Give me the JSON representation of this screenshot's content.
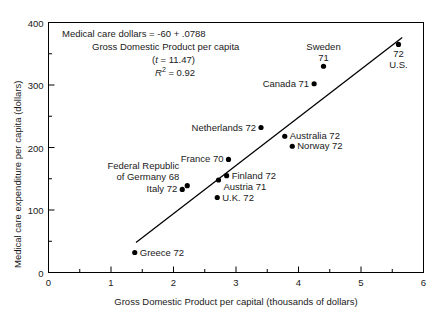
{
  "chart_data": {
    "type": "scatter",
    "title": "",
    "xlabel": "Gross Domestic Product per capital (thousands of dollars)",
    "ylabel": "Medical care expenditure per capita (dollars)",
    "xlim": [
      0,
      6
    ],
    "ylim": [
      0,
      400
    ],
    "xticks": [
      0,
      1,
      2,
      3,
      4,
      5,
      6
    ],
    "xtick_labels": [
      "0",
      "1",
      "2",
      "3",
      "4",
      "5",
      "6"
    ],
    "x_minor_step": 0.5,
    "yticks": [
      0,
      100,
      200,
      300,
      400
    ],
    "ytick_labels": [
      "0",
      "100",
      "200",
      "300",
      "400"
    ],
    "y_minor_step": 50,
    "grid": false,
    "legend": "none",
    "points": [
      {
        "name": "Greece 72",
        "label": "Greece 72",
        "x": 1.38,
        "y": 32,
        "label_pos": "right"
      },
      {
        "name": "Italy 72",
        "label": "Italy 72",
        "x": 2.14,
        "y": 133,
        "label_pos": "left"
      },
      {
        "name": "Federal Republic of Germany 68",
        "label": "Federal Republic\nof Germany 68",
        "x": 2.22,
        "y": 139,
        "label_pos": "upper-left"
      },
      {
        "name": "U.K. 72",
        "label": "U.K. 72",
        "x": 2.7,
        "y": 120,
        "label_pos": "right"
      },
      {
        "name": "Austria 71",
        "label": "Austria 71",
        "x": 2.72,
        "y": 148,
        "label_pos": "lower-right"
      },
      {
        "name": "Finland 72",
        "label": "Finland 72",
        "x": 2.85,
        "y": 155,
        "label_pos": "right"
      },
      {
        "name": "France 70",
        "label": "France 70",
        "x": 2.88,
        "y": 181,
        "label_pos": "left"
      },
      {
        "name": "Netherlands 72",
        "label": "Netherlands 72",
        "x": 3.4,
        "y": 232,
        "label_pos": "left"
      },
      {
        "name": "Australia 72",
        "label": "Australia 72",
        "x": 3.78,
        "y": 218,
        "label_pos": "right"
      },
      {
        "name": "Norway 72",
        "label": "Norway 72",
        "x": 3.9,
        "y": 202,
        "label_pos": "right"
      },
      {
        "name": "Canada 71",
        "label": "Canada 71",
        "x": 4.25,
        "y": 302,
        "label_pos": "left"
      },
      {
        "name": "Sweden 71",
        "label": "Sweden\n71",
        "x": 4.4,
        "y": 330,
        "label_pos": "above"
      },
      {
        "name": "U.S. 72",
        "label": "72\nU.S.",
        "x": 5.6,
        "y": 365,
        "label_pos": "below"
      }
    ],
    "fit_line": {
      "equation_text": "Medical care dollars = -60 + .0788",
      "equation_text_line2": "Gross Domestic Product per capita",
      "intercept": -60,
      "slope": 0.0788,
      "t_statistic": 11.47,
      "r_squared": 0.92,
      "x_start": 1.4,
      "y_start": 48,
      "x_end": 5.66,
      "y_end": 376
    }
  },
  "annotation": {
    "line1": "Medical care dollars = -60 + .0788",
    "line2": "Gross Domestic Product per capita",
    "line3_prefix": "(",
    "line3_italic": "t",
    "line3_suffix": " = 11.47)",
    "line4_italic": "R",
    "line4_sup": "2",
    "line4_suffix": " = 0.92"
  },
  "axes": {
    "y_axis_title": "Medical care expenditure per capita (dollars)",
    "x_axis_title": "Gross Domestic Product per capital (thousands of dollars)"
  },
  "style": {
    "frame_color": "#000000",
    "point_color": "#000000",
    "line_color": "#000000",
    "text_color": "#1a1a1a",
    "background": "#ffffff"
  }
}
